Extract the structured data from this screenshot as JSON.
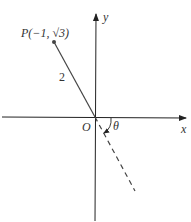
{
  "diagram": {
    "point_label": "P(−1, √3)",
    "segment_label": "2",
    "origin_label": "O",
    "angle_label": "θ",
    "x_axis_label": "x",
    "y_axis_label": "y",
    "colors": {
      "axis": "#222222",
      "line": "#444444"
    }
  }
}
